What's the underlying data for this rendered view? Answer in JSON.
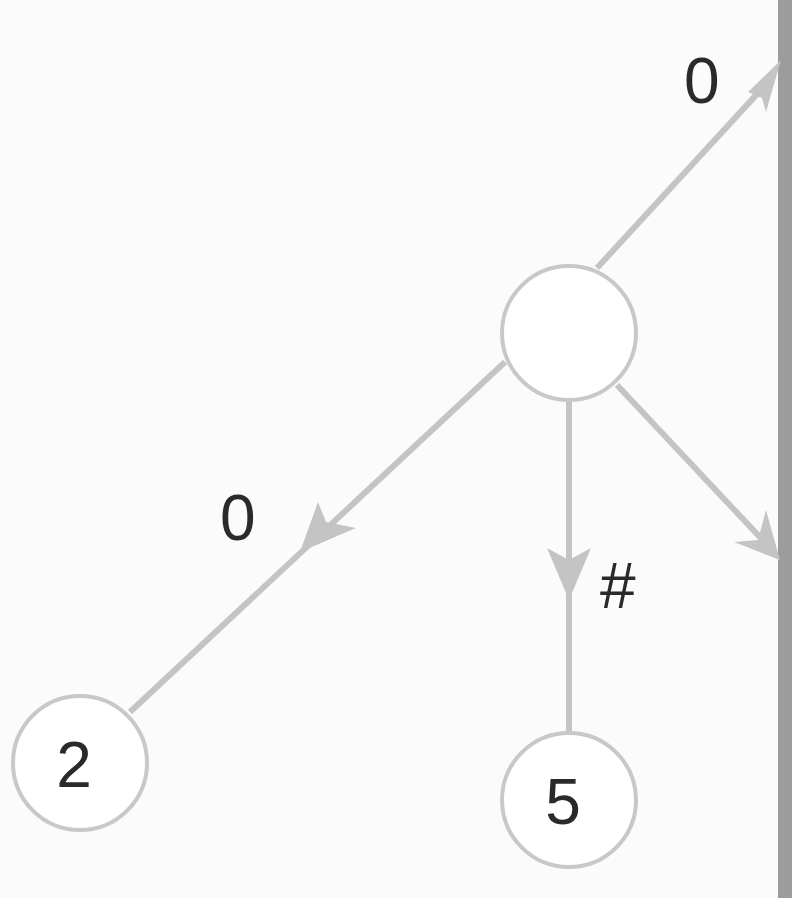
{
  "diagram": {
    "type": "tree",
    "colors": {
      "background": "#fbfbfb",
      "edge": "#c4c4c4",
      "node_stroke": "#c8c8c8",
      "text": "#2a2a2a",
      "page_edge": "#9c9c9c"
    },
    "nodes": [
      {
        "id": "center",
        "label": ""
      },
      {
        "id": "left-child",
        "label": "2"
      },
      {
        "id": "middle-child",
        "label": "5"
      }
    ],
    "edges": [
      {
        "from": "center",
        "to": "offscreen-top-right",
        "label": "0"
      },
      {
        "from": "center",
        "to": "left-child",
        "label": "0"
      },
      {
        "from": "center",
        "to": "middle-child",
        "label": "#"
      },
      {
        "from": "center",
        "to": "offscreen-right",
        "label": ""
      }
    ]
  }
}
